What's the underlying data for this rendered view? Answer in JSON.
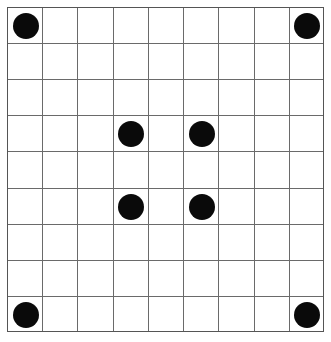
{
  "board": {
    "rows": 9,
    "cols": 9,
    "line_color": "#6a6a6a",
    "background": "#ffffff",
    "stone_color": "#0a0a0a",
    "stones": [
      {
        "row": 0,
        "col": 0,
        "color": "black"
      },
      {
        "row": 0,
        "col": 8,
        "color": "black"
      },
      {
        "row": 3,
        "col": 3,
        "color": "black"
      },
      {
        "row": 3,
        "col": 5,
        "color": "black"
      },
      {
        "row": 5,
        "col": 3,
        "color": "black"
      },
      {
        "row": 5,
        "col": 5,
        "color": "black"
      },
      {
        "row": 8,
        "col": 0,
        "color": "black"
      },
      {
        "row": 8,
        "col": 8,
        "color": "black"
      }
    ]
  }
}
